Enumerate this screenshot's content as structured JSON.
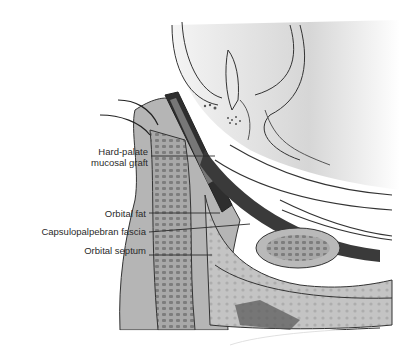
{
  "figure": {
    "type": "anatomical cross-section illustration",
    "palette": {
      "background": "#ffffff",
      "ink": "#2a2a2a",
      "light_tissue": "#d8d8d8",
      "mid_tissue": "#9a9a9a",
      "dark_tissue": "#3a3a3a"
    }
  },
  "labels": [
    {
      "id": "graft",
      "lines": [
        "Hard-palate",
        "mucosal graft"
      ]
    },
    {
      "id": "fat",
      "lines": [
        "Orbital fat"
      ]
    },
    {
      "id": "fascia",
      "lines": [
        "Capsulopalpebran fascia"
      ]
    },
    {
      "id": "septum",
      "lines": [
        "Orbital septum"
      ]
    }
  ]
}
